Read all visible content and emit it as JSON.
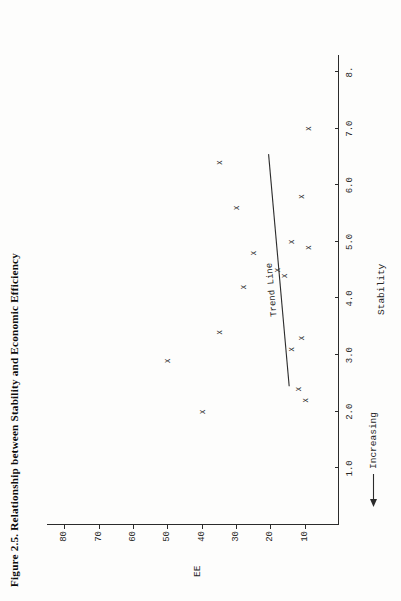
{
  "figure": {
    "title": "Figure 2.5.  Relationship between Stability and Economic Efficiency",
    "y_axis_title": "EE",
    "x_axis_title": "Stability",
    "increasing_label": "Increasing",
    "increasing_arrow_icon": "left-arrow-icon",
    "trend_label": "Trend Line"
  },
  "chart_data": {
    "type": "scatter",
    "title": "Figure 2.5.  Relationship between Stability and Economic Efficiency",
    "xlabel": "Stability",
    "ylabel": "EE",
    "xlim": [
      0,
      8.3
    ],
    "ylim": [
      0,
      85
    ],
    "grid": false,
    "legend": null,
    "marker": "x",
    "xticks": [
      "1.0",
      "2.0",
      "3.0",
      "4.0",
      "5.0",
      "6.0",
      "7.0",
      "8."
    ],
    "xtick_values": [
      1.0,
      2.0,
      3.0,
      4.0,
      5.0,
      6.0,
      7.0,
      8.0
    ],
    "yticks": [
      "10",
      "20",
      "30",
      "40",
      "50",
      "60",
      "70",
      "80"
    ],
    "ytick_values": [
      10,
      20,
      30,
      40,
      50,
      60,
      70,
      80
    ],
    "points": [
      {
        "x": 2.0,
        "y": 40
      },
      {
        "x": 2.2,
        "y": 10
      },
      {
        "x": 2.4,
        "y": 12
      },
      {
        "x": 2.9,
        "y": 50
      },
      {
        "x": 3.1,
        "y": 14
      },
      {
        "x": 3.3,
        "y": 11
      },
      {
        "x": 3.4,
        "y": 35
      },
      {
        "x": 4.2,
        "y": 28
      },
      {
        "x": 4.4,
        "y": 16
      },
      {
        "x": 4.5,
        "y": 18
      },
      {
        "x": 4.8,
        "y": 25
      },
      {
        "x": 4.9,
        "y": 9
      },
      {
        "x": 5.0,
        "y": 14
      },
      {
        "x": 5.6,
        "y": 30
      },
      {
        "x": 5.8,
        "y": 11
      },
      {
        "x": 6.4,
        "y": 35
      },
      {
        "x": 7.0,
        "y": 9
      }
    ],
    "trend_line": {
      "label": "Trend Line",
      "x0": 2.45,
      "y0": 14.5,
      "x1": 6.55,
      "y1": 20.5
    },
    "annotations": [
      {
        "text": "Increasing",
        "target": "x-axis",
        "direction": "left"
      }
    ]
  }
}
